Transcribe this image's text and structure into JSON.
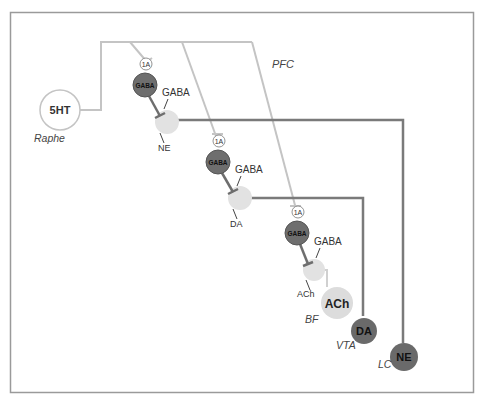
{
  "diagram": {
    "region_label": "PFC",
    "colors": {
      "frame": "#9a9a9a",
      "serotonin_fiber": "#c4c4c4",
      "monoamine_fiber": "#7a7a7a",
      "gaba_neuron": "#6e6e6e",
      "terminal": "#e2e2e2",
      "ach_nucleus": "#dcdcdc",
      "dark_nucleus": "#6a6a6a"
    },
    "source_nuclei": [
      {
        "id": "5ht",
        "label": "5HT",
        "region": "Raphe"
      },
      {
        "id": "ach",
        "label": "ACh",
        "region": "BF"
      },
      {
        "id": "da",
        "label": "DA",
        "region": "VTA"
      },
      {
        "id": "ne",
        "label": "NE",
        "region": "LC"
      }
    ],
    "interneurons": [
      {
        "label": "GABA",
        "receptor": "1A",
        "output_label": "GABA",
        "terminal_label": "NE"
      },
      {
        "label": "GABA",
        "receptor": "1A",
        "output_label": "GABA",
        "terminal_label": "DA"
      },
      {
        "label": "GABA",
        "receptor": "1A",
        "output_label": "GABA",
        "terminal_label": "ACh"
      }
    ]
  }
}
